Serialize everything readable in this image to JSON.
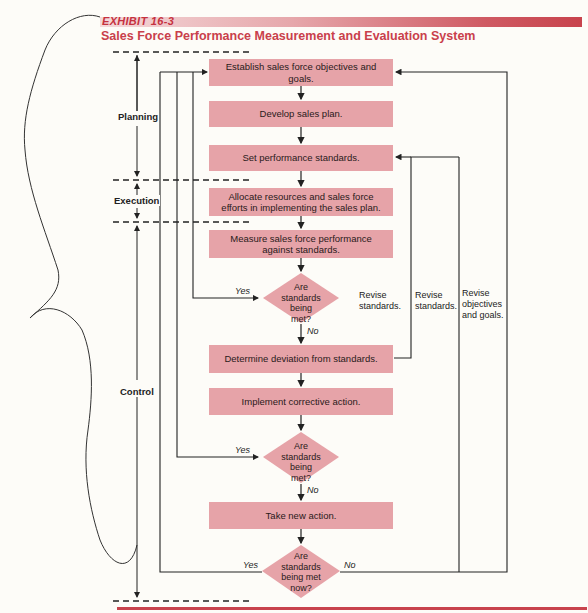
{
  "header": {
    "exhibit_label": "EXHIBIT 16-3",
    "title": "Sales Force Performance Measurement and Evaluation System"
  },
  "colors": {
    "accent_red": "#c8434d",
    "box_fill": "#e6a3a8",
    "line": "#222222"
  },
  "phases": [
    {
      "label": "Planning"
    },
    {
      "label": "Execution"
    },
    {
      "label": "Control"
    }
  ],
  "steps": [
    {
      "id": "objectives",
      "label": "Establish sales force objectives and goals."
    },
    {
      "id": "plan",
      "label": "Develop sales plan."
    },
    {
      "id": "standards",
      "label": "Set performance standards."
    },
    {
      "id": "allocate",
      "label": "Allocate resources and sales force efforts in implementing the sales plan."
    },
    {
      "id": "measure",
      "label": "Measure sales force performance against standards."
    },
    {
      "id": "deviation",
      "label": "Determine deviation from standards."
    },
    {
      "id": "corrective",
      "label": "Implement corrective action."
    },
    {
      "id": "new_action",
      "label": "Take new action."
    }
  ],
  "decisions": [
    {
      "id": "check1",
      "label": "Are standards being met?",
      "yes": "Yes",
      "no": "No"
    },
    {
      "id": "check2",
      "label": "Are standards being met?",
      "yes": "Yes",
      "no": "No"
    },
    {
      "id": "check3",
      "label": "Are standards being met now?",
      "yes": "Yes",
      "no": "No"
    }
  ],
  "feedback_notes": [
    {
      "label": "Revise standards."
    },
    {
      "label": "Revise standards."
    },
    {
      "label": "Revise objectives and goals."
    }
  ]
}
